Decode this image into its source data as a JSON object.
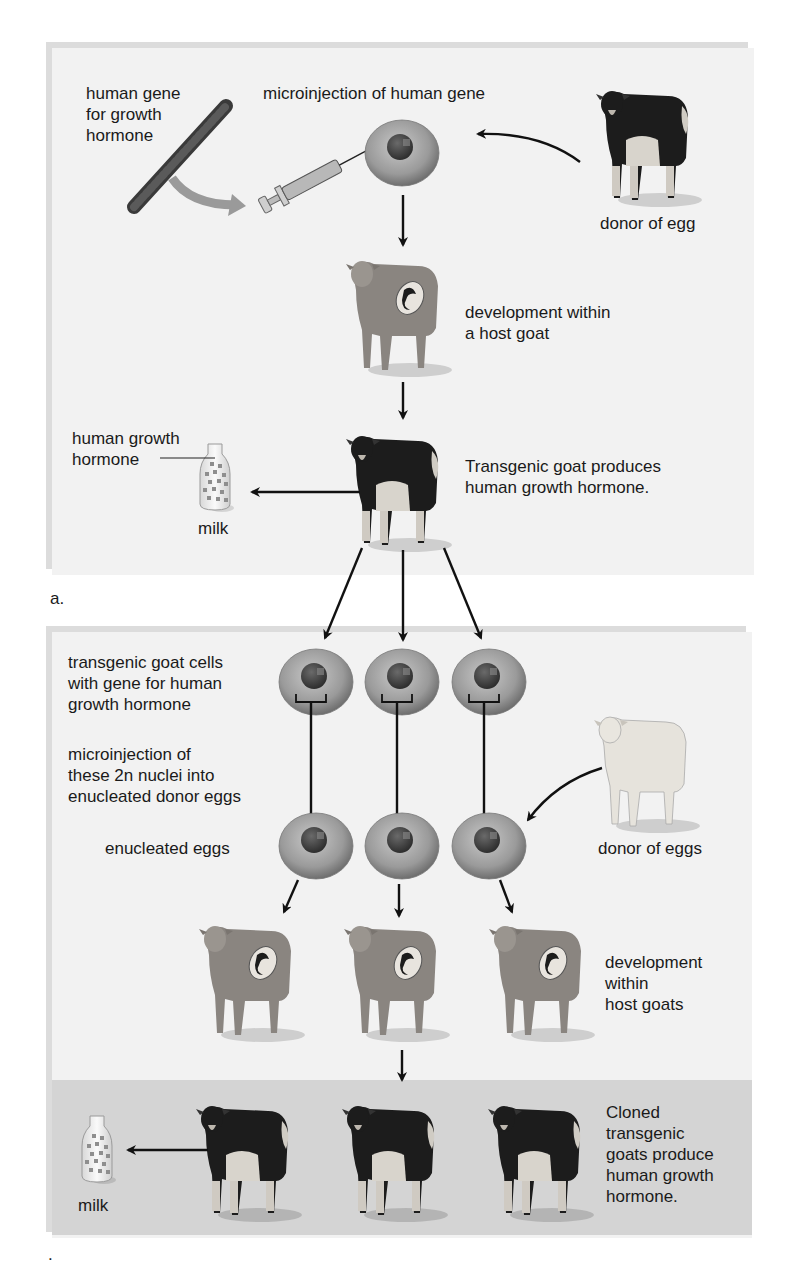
{
  "figure": {
    "panel_a": {
      "label": "a.",
      "labels": {
        "human_gene": "human gene\nfor growth\nhormone",
        "microinjection": "microinjection of human gene",
        "donor_egg": "donor of egg",
        "development_host": "development within\na host goat",
        "hgh_label": "human growth\nhormone",
        "milk": "milk",
        "transgenic": "Transgenic goat produces\nhuman growth hormone."
      }
    },
    "panel_b": {
      "label": ".",
      "labels": {
        "transgenic_cells": "transgenic goat cells\nwith gene for human\ngrowth hormone",
        "microinjection_nuclei": "microinjection of\nthese 2n nuclei into\nenucleated donor eggs",
        "enucleated_eggs": "enucleated eggs",
        "donor_eggs": "donor of eggs",
        "development_hosts": "development\nwithin\nhost goats",
        "milk": "milk",
        "cloned": "Cloned\ntransgenic\ngoats produce\nhuman growth\nhormone."
      }
    },
    "colors": {
      "panel_bg": "#f2f2f2",
      "panel_border": "#dcdcdc",
      "band_bg": "#d4d4d4",
      "arrow": "#111111",
      "goat_dark": "#1c1c1c",
      "goat_light": "#d8d4cc",
      "host_goat": "#8a8580",
      "white_goat": "#e6e3dc",
      "cell": "#8d8d8d",
      "nucleus": "#4a4a4a"
    }
  }
}
